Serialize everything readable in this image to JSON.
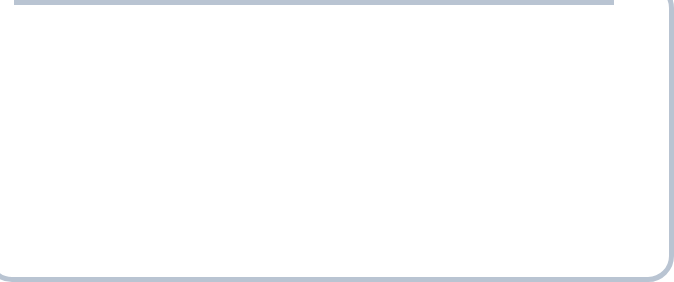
{
  "exhibit": {
    "number": "Exhibit 8.11",
    "title": "Changing Trading Patterns for Manufactured Goods",
    "number_color": "#d4442a",
    "title_color": "#1a1a1a"
  },
  "panel_a": {
    "caption": "(a) U.S. exports and imports of manufactured goods 1960–2012"
  },
  "panel_b": {
    "caption": "(b) Exports of manufactured goods 1960–2010"
  },
  "chart_data": [
    {
      "id": "us-exports-imports",
      "type": "line",
      "title": "",
      "xlabel": "Year",
      "ylabel": "Value in millions of dollars",
      "xlim": [
        1960,
        2012
      ],
      "ylim": [
        0,
        620000
      ],
      "grid": false,
      "legend": "inline-annotations",
      "ytick_labels": [
        "$600,000",
        "500,000",
        "400,000",
        "300,000",
        "200,000",
        "100,000"
      ],
      "ytick_values": [
        600000,
        500000,
        400000,
        300000,
        200000,
        100000
      ],
      "xtick_labels": [
        "1960",
        "1965",
        "1970",
        "1975",
        "1980",
        "1985",
        "1990",
        "1995",
        "2000",
        "2005",
        "2010"
      ],
      "xtick_values": [
        1960,
        1965,
        1970,
        1975,
        1980,
        1985,
        1990,
        1995,
        2000,
        2005,
        2010
      ],
      "minor_xticks_every": 1,
      "annotations": [
        {
          "text": "Imports",
          "x": 1994.0,
          "y": 395000,
          "color": "#111111"
        },
        {
          "text": "Exports",
          "x": 2002.5,
          "y": 255000,
          "color": "#111111"
        }
      ],
      "series": [
        {
          "name": "Imports",
          "color": "#c0803c",
          "x": [
            1960,
            1961,
            1962,
            1963,
            1964,
            1965,
            1966,
            1967,
            1968,
            1969,
            1970,
            1971,
            1972,
            1973,
            1974,
            1975,
            1976,
            1977,
            1978,
            1979,
            1980,
            1981,
            1982,
            1983,
            1984,
            1985,
            1986,
            1987,
            1988,
            1989,
            1990,
            1991,
            1992,
            1993,
            1994,
            1995,
            1996,
            1997,
            1998,
            1999,
            2000,
            2001,
            2002,
            2003,
            2004,
            2005,
            2006,
            2007,
            2008,
            2009,
            2010,
            2011,
            2012
          ],
          "values": [
            20000,
            21000,
            23000,
            25000,
            28000,
            33000,
            40000,
            43000,
            52000,
            58000,
            63000,
            72000,
            85000,
            100000,
            128000,
            125000,
            145000,
            165000,
            190000,
            215000,
            242000,
            248000,
            235000,
            245000,
            305000,
            315000,
            330000,
            350000,
            375000,
            390000,
            395000,
            385000,
            410000,
            435000,
            480000,
            510000,
            525000,
            560000,
            575000,
            600000,
            660000,
            620000,
            630000,
            665000,
            740000,
            800000,
            850000,
            860000,
            830000,
            600000,
            730000,
            780000,
            800000
          ],
          "values_display": [
            26000,
            28000,
            30000,
            33000,
            38000,
            45000,
            54000,
            58000,
            68000,
            80000,
            88000,
            98000,
            118000,
            140000,
            150000,
            143000,
            165000,
            185000,
            205000,
            230000,
            248000,
            252000,
            230000,
            240000,
            245000,
            235000,
            245000,
            255000,
            270000,
            280000,
            290000,
            285000,
            305000,
            325000,
            350000,
            375000,
            390000,
            410000,
            420000,
            440000,
            465000,
            430000,
            455000,
            480000,
            520000,
            560000,
            575000,
            540000,
            430000,
            480000,
            520000,
            540000,
            545000
          ]
        },
        {
          "name": "Exports",
          "color": "#7b91a7",
          "x": [
            1960,
            1961,
            1962,
            1963,
            1964,
            1965,
            1966,
            1967,
            1968,
            1969,
            1970,
            1971,
            1972,
            1973,
            1974,
            1975,
            1976,
            1977,
            1978,
            1979,
            1980,
            1981,
            1982,
            1983,
            1984,
            1985,
            1986,
            1987,
            1988,
            1989,
            1990,
            1991,
            1992,
            1993,
            1994,
            1995,
            1996,
            1997,
            1998,
            1999,
            2000,
            2001,
            2002,
            2003,
            2004,
            2005,
            2006,
            2007,
            2008,
            2009,
            2010,
            2011,
            2012
          ],
          "values_display": [
            40000,
            41000,
            43000,
            46000,
            52000,
            55000,
            60000,
            64000,
            70000,
            78000,
            88000,
            90000,
            100000,
            125000,
            143000,
            140000,
            140000,
            145000,
            160000,
            180000,
            185000,
            183000,
            165000,
            150000,
            160000,
            148000,
            155000,
            170000,
            195000,
            215000,
            230000,
            240000,
            245000,
            250000,
            265000,
            300000,
            310000,
            330000,
            325000,
            320000,
            345000,
            305000,
            290000,
            300000,
            340000,
            380000,
            430000,
            470000,
            490000,
            375000,
            460000,
            515000,
            535000
          ]
        }
      ]
    },
    {
      "id": "world-exports",
      "type": "line",
      "title": "",
      "xlabel": "Year",
      "ylabel": "Value in millions of dollars",
      "xlim": [
        1960,
        2010
      ],
      "ylim": [
        0,
        1650000
      ],
      "grid": false,
      "legend": "inline-annotations",
      "ytick_labels": [
        "1,600,000",
        "1,400,000",
        "1,200,000",
        "1,000,000",
        "800,000",
        "600,000",
        "400,000",
        "200,000"
      ],
      "ytick_values": [
        1600000,
        1400000,
        1200000,
        1000000,
        800000,
        600000,
        400000,
        200000
      ],
      "xtick_labels": [
        "1960",
        "1965",
        "1970",
        "1975",
        "1980",
        "1985",
        "1990",
        "1995",
        "2000",
        "2005",
        "2010"
      ],
      "xtick_values": [
        1960,
        1965,
        1970,
        1975,
        1980,
        1985,
        1990,
        1995,
        2000,
        2005,
        2010
      ],
      "minor_xticks_every": 1,
      "annotations": [
        {
          "text": "China",
          "x": 2006.0,
          "y": 1430000,
          "color": "#111111"
        },
        {
          "text": "United States",
          "x": 1993.0,
          "y": 870000,
          "color": "#111111"
        },
        {
          "text": "United",
          "x": 1997.5,
          "y": 580000,
          "color": "#111111"
        },
        {
          "text": "Kingdom",
          "x": 1997.5,
          "y": 450000,
          "color": "#111111"
        }
      ],
      "series": [
        {
          "name": "United States",
          "color": "#7b91a7",
          "x": [
            1960,
            1962,
            1964,
            1966,
            1968,
            1970,
            1972,
            1973,
            1974,
            1975,
            1976,
            1977,
            1978,
            1979,
            1980,
            1981,
            1982,
            1983,
            1984,
            1985,
            1986,
            1987,
            1988,
            1989,
            1990,
            1991,
            1992,
            1993,
            1994,
            1995,
            1996,
            1997,
            1998,
            1999,
            2000,
            2001,
            2002,
            2003,
            2004,
            2005,
            2006,
            2007,
            2008,
            2009,
            2010
          ],
          "values_display": [
            140000,
            155000,
            175000,
            205000,
            235000,
            250000,
            240000,
            300000,
            430000,
            440000,
            450000,
            430000,
            460000,
            520000,
            560000,
            530000,
            470000,
            430000,
            415000,
            410000,
            480000,
            560000,
            650000,
            730000,
            790000,
            830000,
            860000,
            900000,
            840000,
            900000,
            960000,
            1000000,
            930000,
            880000,
            950000,
            1020000,
            1080000,
            1130000,
            1200000,
            1270000,
            1320000,
            1200000,
            1130000,
            1140000,
            1270000
          ]
        },
        {
          "name": "United Kingdom",
          "color": "#c0803c",
          "x": [
            1960,
            1962,
            1964,
            1966,
            1968,
            1970,
            1972,
            1974,
            1975,
            1976,
            1977,
            1978,
            1979,
            1980,
            1981,
            1982,
            1983,
            1984,
            1985,
            1986,
            1987,
            1988,
            1989,
            1990,
            1991,
            1992,
            1993,
            1994,
            1995,
            1996,
            1997,
            1998,
            1999,
            2000,
            2001,
            2002,
            2003,
            2004,
            2005,
            2006,
            2007,
            2008,
            2009,
            2010
          ],
          "values_display": [
            65000,
            70000,
            78000,
            82000,
            80000,
            95000,
            105000,
            125000,
            150000,
            155000,
            190000,
            215000,
            250000,
            290000,
            250000,
            235000,
            230000,
            240000,
            275000,
            270000,
            275000,
            290000,
            300000,
            330000,
            340000,
            350000,
            330000,
            340000,
            325000,
            320000,
            340000,
            330000,
            330000,
            355000,
            390000,
            400000,
            430000,
            460000,
            475000,
            465000,
            440000,
            470000,
            390000,
            410000
          ]
        },
        {
          "name": "China",
          "color": "#cc3a22",
          "x": [
            1984,
            1985,
            1986,
            1987,
            1988,
            1989,
            1990,
            1991,
            1992,
            1993,
            1994,
            1995,
            1996,
            1997,
            1998,
            1999,
            2000,
            2001,
            2002,
            2003,
            2004,
            2005,
            2006,
            2007,
            2008,
            2009,
            2010
          ],
          "values_display": [
            10000,
            8000,
            20000,
            40000,
            60000,
            75000,
            90000,
            105000,
            125000,
            145000,
            180000,
            210000,
            225000,
            250000,
            265000,
            290000,
            330000,
            360000,
            430000,
            560000,
            700000,
            870000,
            1080000,
            1350000,
            1150000,
            1100000,
            1510000
          ]
        }
      ]
    }
  ]
}
